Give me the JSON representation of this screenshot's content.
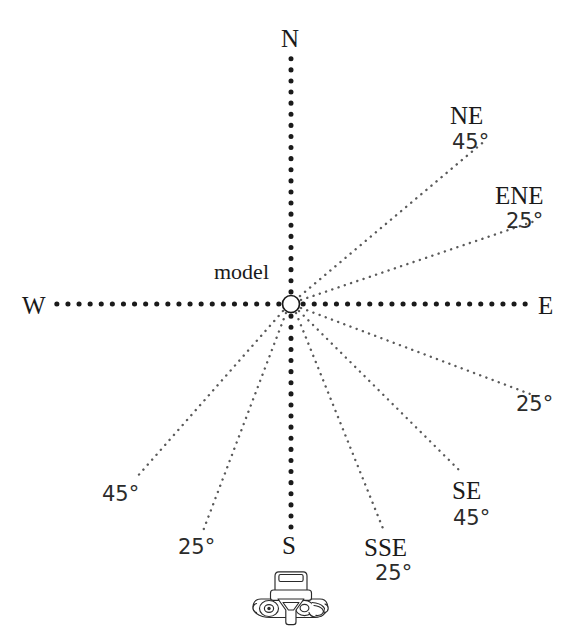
{
  "figure": {
    "type": "compass-azimuth-diagram",
    "background_color": "#ffffff",
    "line_color": "#1a1a1a",
    "ray_color": "#555555",
    "center_label": "model"
  },
  "cardinals": {
    "north": "N",
    "south": "S",
    "west": "W",
    "east": "E"
  },
  "center": {
    "label": "model",
    "x": 291,
    "y": 304,
    "radius": 8
  },
  "axes": [
    {
      "name": "north-axis",
      "from": "center",
      "direction": "N",
      "style": "bold-dotted"
    },
    {
      "name": "south-axis",
      "from": "center",
      "direction": "S",
      "style": "bold-dotted"
    },
    {
      "name": "west-axis",
      "from": "center",
      "direction": "W",
      "style": "bold-dotted"
    },
    {
      "name": "east-axis",
      "from": "center",
      "direction": "E",
      "style": "bold-dotted"
    }
  ],
  "rays": [
    {
      "id": "ne",
      "direction_label": "NE",
      "angle_label": "45°",
      "bearing_from_east_deg": 45,
      "quadrant": "upper-right"
    },
    {
      "id": "ene",
      "direction_label": "ENE",
      "angle_label": "25°",
      "bearing_from_east_deg": 25,
      "quadrant": "upper-right"
    },
    {
      "id": "ese",
      "direction_label": "",
      "angle_label": "25°",
      "bearing_from_east_deg": -25,
      "quadrant": "lower-right"
    },
    {
      "id": "se",
      "direction_label": "SE",
      "angle_label": "45°",
      "bearing_from_east_deg": -45,
      "quadrant": "lower-right"
    },
    {
      "id": "sse",
      "direction_label": "SSE",
      "angle_label": "25°",
      "bearing_from_east_deg": -65,
      "quadrant": "lower-right"
    },
    {
      "id": "sw",
      "direction_label": "",
      "angle_label": "45°",
      "bearing_from_east_deg": 225,
      "quadrant": "lower-left"
    },
    {
      "id": "ssw",
      "direction_label": "",
      "angle_label": "25°",
      "bearing_from_east_deg": 245,
      "quadrant": "lower-left"
    }
  ],
  "labels": {
    "ne_name": "NE",
    "ne_angle": "45°",
    "ene_name": "ENE",
    "ene_angle": "25°",
    "ese_angle": "25°",
    "se_name": "SE",
    "se_angle": "45°",
    "sse_name": "SSE",
    "sse_angle": "25°",
    "sw_angle": "45°",
    "ssw_angle": "25°"
  },
  "camera": {
    "name": "camera-icon",
    "description": "top-view 35mm camera illustration"
  }
}
